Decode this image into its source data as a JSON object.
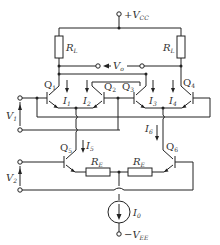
{
  "diagram": {
    "type": "circuit-schematic",
    "supplies": {
      "vcc": "+V",
      "vcc_sub": "CC",
      "vee": "−V",
      "vee_sub": "EE"
    },
    "output": {
      "label": "V",
      "sub": "o"
    },
    "inputs": [
      {
        "label": "V",
        "sub": "1"
      },
      {
        "label": "V",
        "sub": "2"
      }
    ],
    "resistors": {
      "load": {
        "label": "R",
        "sub": "L"
      },
      "emitter": {
        "label": "R",
        "sub": "E"
      }
    },
    "transistors": [
      {
        "label": "Q",
        "sub": "1"
      },
      {
        "label": "Q",
        "sub": "2"
      },
      {
        "label": "Q",
        "sub": "3"
      },
      {
        "label": "Q",
        "sub": "4"
      },
      {
        "label": "Q",
        "sub": "5"
      },
      {
        "label": "Q",
        "sub": "6"
      }
    ],
    "currents": [
      {
        "label": "I",
        "sub": "1"
      },
      {
        "label": "I",
        "sub": "2"
      },
      {
        "label": "I",
        "sub": "3"
      },
      {
        "label": "I",
        "sub": "4"
      },
      {
        "label": "I",
        "sub": "5"
      },
      {
        "label": "I",
        "sub": "6"
      },
      {
        "label": "I",
        "sub": "0"
      }
    ]
  }
}
